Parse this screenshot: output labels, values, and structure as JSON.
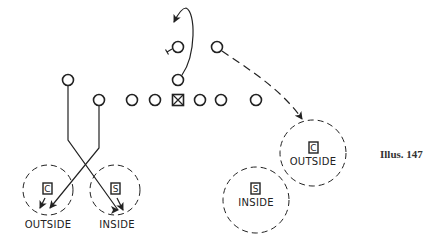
{
  "caption": "Illus. 147",
  "colors": {
    "ink": "#222222",
    "background": "#ffffff"
  },
  "offense": {
    "center_marker": "X-box",
    "line_row_y": 100,
    "players": [
      {
        "role": "split-end",
        "x": 68,
        "y": 80
      },
      {
        "role": "lineman",
        "x": 99,
        "y": 100
      },
      {
        "role": "lineman",
        "x": 132,
        "y": 100
      },
      {
        "role": "lineman",
        "x": 155,
        "y": 100
      },
      {
        "role": "center",
        "x": 178,
        "y": 100
      },
      {
        "role": "lineman",
        "x": 200,
        "y": 100
      },
      {
        "role": "lineman",
        "x": 221,
        "y": 100
      },
      {
        "role": "end",
        "x": 256,
        "y": 100
      },
      {
        "role": "quarterback",
        "x": 178,
        "y": 80
      },
      {
        "role": "back-left",
        "x": 178,
        "y": 47
      },
      {
        "role": "back-right",
        "x": 217,
        "y": 47
      }
    ]
  },
  "zones": {
    "left": [
      {
        "letter": "C",
        "label": "OUTSIDE"
      },
      {
        "letter": "S",
        "label": "INSIDE"
      }
    ],
    "right": [
      {
        "letter": "C",
        "label": "OUTSIDE"
      },
      {
        "letter": "S",
        "label": "INSIDE"
      }
    ]
  }
}
